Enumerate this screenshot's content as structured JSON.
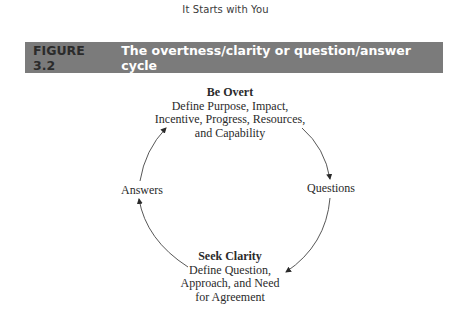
{
  "page": {
    "running_head": "It Starts with You"
  },
  "figure": {
    "number": "FIGURE 3.2",
    "title": "The overtness/clarity or question/answer cycle",
    "banner_color": "#7b7b7b"
  },
  "diagram": {
    "type": "cycle",
    "nodes": {
      "top": {
        "heading": "Be Overt",
        "lines": [
          "Define Purpose, Impact,",
          "Incentive, Progress, Resources,",
          "and Capability"
        ]
      },
      "right": {
        "label": "Questions"
      },
      "bottom": {
        "heading": "Seek Clarity",
        "lines": [
          "Define Question,",
          "Approach, and Need",
          "for Agreement"
        ]
      },
      "left": {
        "label": "Answers"
      }
    },
    "edges": [
      {
        "from": "Be Overt",
        "to": "Questions"
      },
      {
        "from": "Questions",
        "to": "Seek Clarity"
      },
      {
        "from": "Seek Clarity",
        "to": "Answers"
      },
      {
        "from": "Answers",
        "to": "Be Overt"
      }
    ]
  }
}
